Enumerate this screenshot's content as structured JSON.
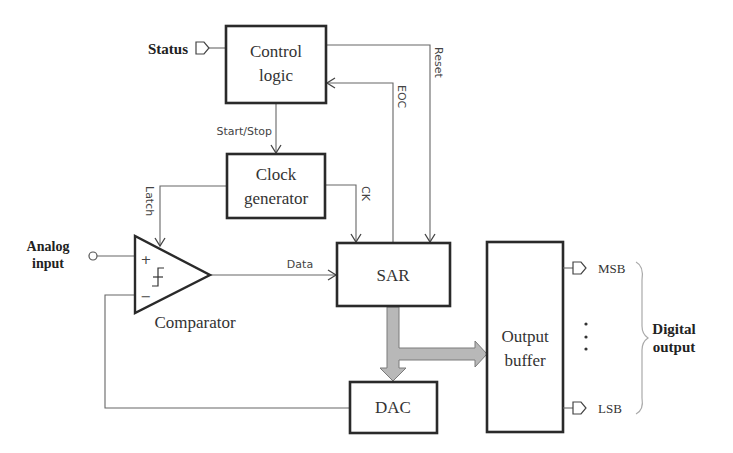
{
  "diagram": {
    "blocks": {
      "control_logic": {
        "line1": "Control",
        "line2": "logic"
      },
      "clock_generator": {
        "line1": "Clock",
        "line2": "generator"
      },
      "sar": {
        "label": "SAR"
      },
      "dac": {
        "label": "DAC"
      },
      "output_buffer": {
        "line1": "Output",
        "line2": "buffer"
      },
      "comparator": {
        "label": "Comparator",
        "plus": "+",
        "minus": "−"
      }
    },
    "signals": {
      "status": "Status",
      "start_stop": "Start/Stop",
      "reset": "Reset",
      "eoc": "EOC",
      "ck": "CK",
      "latch": "Latch",
      "data": "Data"
    },
    "io": {
      "analog_input_line1": "Analog",
      "analog_input_line2": "input",
      "msb": "MSB",
      "lsb": "LSB",
      "ellipsis": "⋮",
      "digital_output_line1": "Digital",
      "digital_output_line2": "output"
    },
    "colors": {
      "box_stroke": "#2a2a2a",
      "wire": "#666666",
      "bus_fill": "#b8b8b8"
    }
  }
}
